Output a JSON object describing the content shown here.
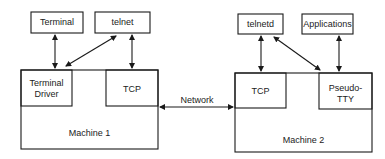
{
  "diagram": {
    "machine1": {
      "label": "Machine 1",
      "terminal_driver": {
        "line1": "Terminal",
        "line2": "Driver"
      },
      "tcp": "TCP"
    },
    "machine2": {
      "label": "Machine 2",
      "tcp": "TCP",
      "pseudo_tty": {
        "line1": "Pseudo-",
        "line2": "TTY"
      }
    },
    "top_left": {
      "terminal": "Terminal",
      "telnet": "telnet"
    },
    "top_right": {
      "telnetd": "telnetd",
      "applications": "Applications"
    },
    "network_label": "Network",
    "colors": {
      "stroke": "#1a1a1a",
      "background": "#ffffff"
    }
  }
}
